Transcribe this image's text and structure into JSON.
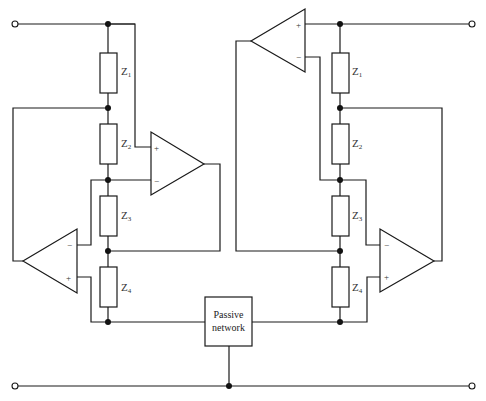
{
  "diagram": {
    "type": "circuit-schematic",
    "left_branch": {
      "impedances": [
        {
          "label": "Z",
          "sub": "1"
        },
        {
          "label": "Z",
          "sub": "2"
        },
        {
          "label": "Z",
          "sub": "3"
        },
        {
          "label": "Z",
          "sub": "4"
        }
      ],
      "opamp_upper": {
        "plus": "+",
        "minus": "−"
      },
      "opamp_lower": {
        "plus": "+",
        "minus": "−"
      }
    },
    "right_branch": {
      "impedances": [
        {
          "label": "Z",
          "sub": "1"
        },
        {
          "label": "Z",
          "sub": "2"
        },
        {
          "label": "Z",
          "sub": "3"
        },
        {
          "label": "Z",
          "sub": "4"
        }
      ],
      "opamp_upper": {
        "plus": "+",
        "minus": "−"
      },
      "opamp_lower": {
        "plus": "+",
        "minus": "−"
      }
    },
    "passive_network": {
      "line1": "Passive",
      "line2": "network"
    },
    "colors": {
      "line": "#1a1a1a",
      "background": "#ffffff"
    }
  }
}
